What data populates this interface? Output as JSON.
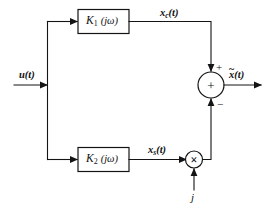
{
  "diagram": {
    "canvas": {
      "width": 269,
      "height": 207,
      "background": "#ffffff"
    },
    "ink_color": "#141414",
    "input": {
      "label": "u(t)",
      "name": "input-signal-label"
    },
    "blocks": [
      {
        "id": "k1",
        "gain": "K",
        "subscript": "1",
        "argument": "(jω)",
        "full_label": "K1 (jω)"
      },
      {
        "id": "k2",
        "gain": "K",
        "subscript": "2",
        "argument": "(jω)",
        "full_label": "K2 (jω)"
      }
    ],
    "signals": {
      "top_branch": {
        "base": "x",
        "subscript": "c",
        "suffix": "(t)",
        "full": "xc(t)"
      },
      "bottom_branch": {
        "base": "x",
        "subscript": "s",
        "suffix": "(t)",
        "full": "xs(t)"
      },
      "multiplier_input": {
        "full": "j"
      },
      "output": {
        "base": "x",
        "accent": "~",
        "suffix": "(t)",
        "full": "x̃(t)"
      }
    },
    "summing_junction": {
      "interior_glyph": "+",
      "top_sign": "+",
      "bottom_sign": "−"
    },
    "multiplier": {
      "interior_glyph": "×"
    }
  }
}
